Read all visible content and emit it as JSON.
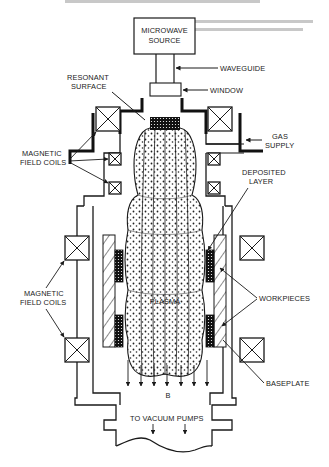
{
  "figure": {
    "type": "schematic",
    "header_text_faint": true
  },
  "labels": {
    "microwave_source_line1": "MICROWAVE",
    "microwave_source_line2": "SOURCE",
    "waveguide": "WAVEGUIDE",
    "window": "WINDOW",
    "resonant_surface_line1": "RESONANT",
    "resonant_surface_line2": "SURFACE",
    "magnetic_coils_upper_line1": "MAGNETIC",
    "magnetic_coils_upper_line2": "FIELD COILS",
    "gas_supply_line1": "GAS",
    "gas_supply_line2": "SUPPLY",
    "deposited_layer_line1": "DEPOSITED",
    "deposited_layer_line2": "LAYER",
    "magnetic_coils_lower_line1": "MAGNETIC",
    "magnetic_coils_lower_line2": "FIELD COILS",
    "workpieces": "WORKPIECES",
    "plasma": "PLASMA",
    "b_field": "B",
    "baseplate": "BASEPLATE",
    "vacuum": "TO VACUUM PUMPS"
  },
  "colors": {
    "ink": "#1a1a1a",
    "background": "#ffffff",
    "faint_text": "#c8c8c8"
  }
}
